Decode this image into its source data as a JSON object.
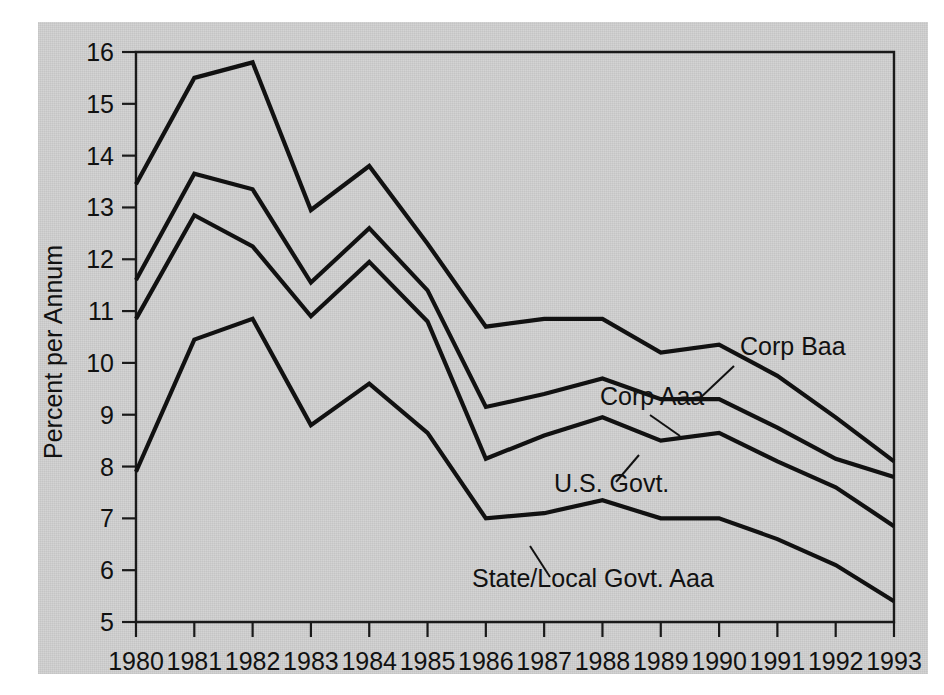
{
  "chart_data": {
    "type": "line",
    "title": "",
    "subtitle": "",
    "xlabel": "",
    "ylabel": "Percent per Annum",
    "x": [
      1980,
      1981,
      1982,
      1983,
      1984,
      1985,
      1986,
      1987,
      1988,
      1989,
      1990,
      1991,
      1992,
      1993
    ],
    "categories": [
      "1980",
      "1981",
      "1982",
      "1983",
      "1984",
      "1985",
      "1986",
      "1987",
      "1988",
      "1989",
      "1990",
      "1991",
      "1992",
      "1993"
    ],
    "xlim": [
      1980,
      1993
    ],
    "ylim": [
      5,
      16
    ],
    "yticks": [
      5,
      6,
      7,
      8,
      9,
      10,
      11,
      12,
      13,
      14,
      15,
      16
    ],
    "ytick_labels": [
      "5",
      "6",
      "7",
      "8",
      "9",
      "10",
      "11",
      "12",
      "13",
      "14",
      "15",
      "16"
    ],
    "grid": false,
    "legend_position": "inline-annotations",
    "series": [
      {
        "name": "Corp Baa",
        "label": "Corp Baa",
        "values": [
          13.45,
          15.5,
          15.8,
          12.95,
          13.8,
          12.3,
          10.7,
          10.85,
          10.85,
          10.2,
          10.35,
          9.75,
          8.95,
          8.1
        ]
      },
      {
        "name": "Corp Aaa",
        "label": "Corp Aaa",
        "values": [
          11.6,
          13.65,
          13.35,
          11.55,
          12.6,
          11.4,
          9.15,
          9.4,
          9.7,
          9.3,
          9.3,
          8.75,
          8.15,
          7.8
        ]
      },
      {
        "name": "U.S. Govt.",
        "label": "U.S. Govt.",
        "values": [
          10.85,
          12.85,
          12.25,
          10.9,
          11.95,
          10.8,
          8.15,
          8.6,
          8.95,
          8.5,
          8.65,
          8.1,
          7.6,
          6.85
        ]
      },
      {
        "name": "State/Local Govt. Aaa",
        "label": "State/Local Govt. Aaa",
        "values": [
          7.9,
          10.45,
          10.85,
          8.8,
          9.6,
          8.65,
          7.0,
          7.1,
          7.35,
          7.0,
          7.0,
          6.6,
          6.1,
          5.4
        ]
      }
    ],
    "annotations": [
      {
        "text": "Corp Baa",
        "series": "Corp Baa",
        "x": 1990.85,
        "y": 10.35
      },
      {
        "text": "Corp Aaa",
        "series": "Corp Aaa",
        "x": 1989.5,
        "y": 9.75
      },
      {
        "text": "U.S. Govt.",
        "series": "U.S. Govt.",
        "x": 1988.6,
        "y": 8.1
      },
      {
        "text": "State/Local Govt. Aaa",
        "series": "State/Local Govt. Aaa",
        "x": 1988.1,
        "y": 6.15
      }
    ],
    "colors": {
      "background": "#d2d2d2",
      "page": "#ffffff",
      "line": "#111111",
      "axis": "#1a1a1a",
      "text": "#111111"
    }
  }
}
